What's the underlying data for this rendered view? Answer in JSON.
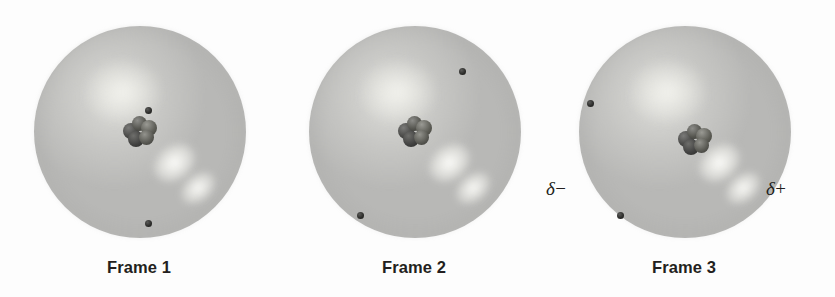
{
  "figure": {
    "background_color": "#fdfdfd",
    "sphere_color": "#b8b8b6",
    "nucleus_color": "#3a3a34",
    "electron_color": "#2b2b29",
    "label_color": "#231f20"
  },
  "frames": [
    {
      "caption": "Frame 1",
      "sphere": {
        "cx": 140,
        "cy": 132,
        "r": 106
      },
      "nucleus": {
        "x": 123,
        "y": 116
      },
      "electrons": [
        {
          "x": 145,
          "y": 107
        },
        {
          "x": 145,
          "y": 220
        }
      ],
      "charges": []
    },
    {
      "caption": "Frame 2",
      "sphere": {
        "cx": 415,
        "cy": 132,
        "r": 106
      },
      "nucleus": {
        "x": 398,
        "y": 116
      },
      "electrons": [
        {
          "x": 459,
          "y": 68
        },
        {
          "x": 357,
          "y": 212
        }
      ],
      "charges": []
    },
    {
      "caption": "Frame 3",
      "sphere": {
        "cx": 685,
        "cy": 132,
        "r": 106
      },
      "nucleus": {
        "x": 661,
        "y": 124
      },
      "electrons": [
        {
          "x": 587,
          "y": 100
        },
        {
          "x": 617,
          "y": 212
        }
      ],
      "charges": [
        {
          "name": "partial-negative",
          "symbol": "δ",
          "sign": "−",
          "x": 546,
          "y": 186
        },
        {
          "name": "partial-positive",
          "symbol": "δ",
          "sign": "+",
          "x": 766,
          "y": 186
        }
      ]
    }
  ]
}
